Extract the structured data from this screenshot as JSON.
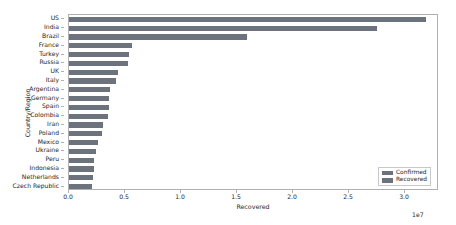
{
  "chart_data": {
    "type": "bar",
    "orientation": "horizontal",
    "title": "",
    "xlabel": "Recovered",
    "ylabel": "Country/Region",
    "x_exponent": "1e7",
    "xlim": [
      0,
      33035714
    ],
    "xticks": [
      "0.0",
      "0.5",
      "1.0",
      "1.5",
      "2.0",
      "2.5",
      "3.0"
    ],
    "xtick_values": [
      0,
      5000000,
      10000000,
      15000000,
      20000000,
      25000000,
      30000000
    ],
    "grid": false,
    "legend_position": "lower right",
    "categories": [
      "US",
      "India",
      "Brazil",
      "France",
      "Turkey",
      "Russia",
      "UK",
      "Italy",
      "Argentina",
      "Germany",
      "Spain",
      "Colombia",
      "Iran",
      "Poland",
      "Mexico",
      "Ukraine",
      "Peru",
      "Indonesia",
      "Netherlands",
      "Czech Republic"
    ],
    "series": [
      {
        "name": "Confirmed",
        "color": "#6d737c",
        "values": [
          31875000,
          27500000,
          15892857,
          5625000,
          5357143,
          5267857,
          4375000,
          4196429,
          3660714,
          3571429,
          3571429,
          3482143,
          3035714,
          2946429,
          2589286,
          2410714,
          2232143,
          2232143,
          2142857,
          2053571
        ]
      },
      {
        "name": "Recovered",
        "color": "#6d737c",
        "values": [
          31875000,
          27500000,
          15892857,
          5625000,
          5357143,
          5267857,
          4375000,
          4196429,
          3660714,
          3571429,
          3571429,
          3482143,
          3035714,
          2946429,
          2589286,
          2410714,
          2232143,
          2232143,
          2142857,
          2053571
        ]
      }
    ],
    "legend": [
      {
        "label": "Confirmed",
        "color": "#6d737c"
      },
      {
        "label": "Recovered",
        "color": "#6d737c"
      }
    ]
  }
}
